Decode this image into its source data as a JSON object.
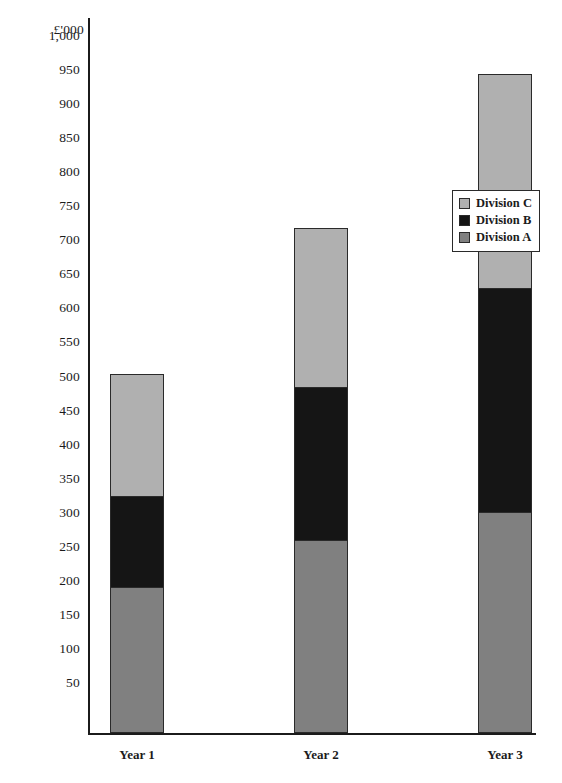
{
  "chart_data": {
    "type": "bar",
    "subtype": "stacked-bar",
    "title": "",
    "xlabel": "",
    "ylabel": "£'000",
    "categories": [
      "Year 1",
      "Year 2",
      "Year 3"
    ],
    "series": [
      {
        "name": "Division A",
        "values": [
          215,
          283,
          325
        ],
        "color": "#808080"
      },
      {
        "name": "Division B",
        "values": [
          135,
          227,
          330
        ],
        "color": "#151515"
      },
      {
        "name": "Division C",
        "values": [
          180,
          235,
          315
        ],
        "color": "#b0b0b0"
      }
    ],
    "stack_totals": [
      530,
      745,
      970
    ],
    "ylim": [
      0,
      1000
    ],
    "ytick_step": 50,
    "ytick_labels": [
      "1,000",
      "950",
      "900",
      "850",
      "800",
      "750",
      "700",
      "650",
      "600",
      "550",
      "500",
      "450",
      "400",
      "350",
      "300",
      "250",
      "200",
      "150",
      "100",
      "50"
    ],
    "ytick_values": [
      1000,
      950,
      900,
      850,
      800,
      750,
      700,
      650,
      600,
      550,
      500,
      450,
      400,
      350,
      300,
      250,
      200,
      150,
      100,
      50
    ],
    "grid": false,
    "legend_position": "right-upper",
    "legend_order": [
      "Division C",
      "Division B",
      "Division A"
    ],
    "axis_color": "#1b1b1b",
    "background": "#ffffff"
  },
  "legend": {
    "entries": [
      {
        "label": "Division C",
        "color": "#b0b0b0"
      },
      {
        "label": "Division B",
        "color": "#151515"
      },
      {
        "label": "Division A",
        "color": "#808080"
      }
    ]
  }
}
